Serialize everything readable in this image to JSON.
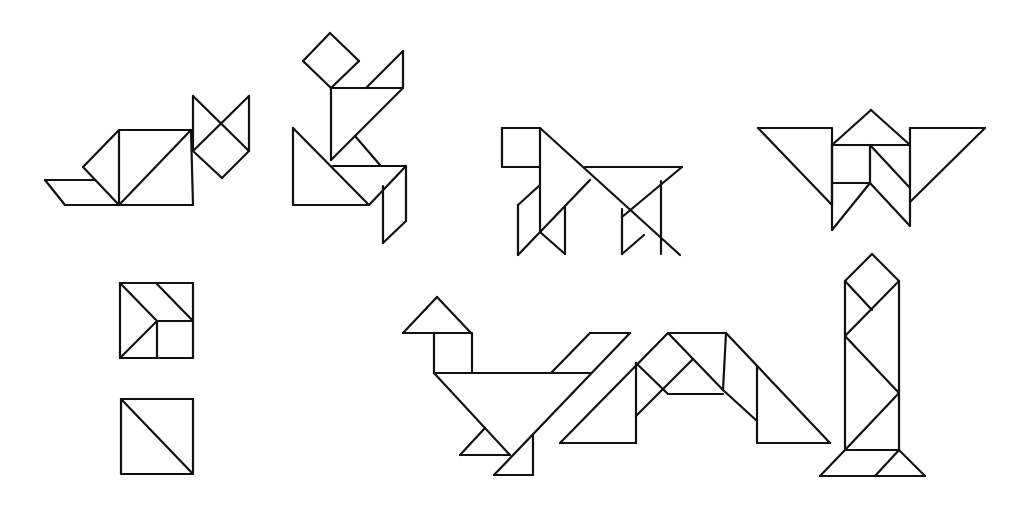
{
  "diagram": {
    "title": "",
    "background": "#ffffff",
    "stroke_color": "#111111",
    "figures": [
      {
        "name": "cat",
        "segments": [
          [
            45,
            180,
            95,
            180
          ],
          [
            45,
            180,
            65,
            205
          ],
          [
            65,
            205,
            193,
            205
          ],
          [
            83,
            167,
            119,
            130
          ],
          [
            83,
            167,
            119,
            205
          ],
          [
            119,
            130,
            119,
            205
          ],
          [
            119,
            130,
            191,
            130
          ],
          [
            119,
            205,
            191,
            130
          ],
          [
            191,
            130,
            193,
            205
          ],
          [
            193,
            96,
            249,
            151
          ],
          [
            193,
            96,
            193,
            151
          ],
          [
            193,
            151,
            222,
            178
          ],
          [
            222,
            178,
            249,
            151
          ],
          [
            249,
            96,
            249,
            151
          ],
          [
            193,
            151,
            249,
            96
          ]
        ]
      },
      {
        "name": "runner",
        "segments": [
          [
            303,
            61,
            330,
            33
          ],
          [
            330,
            33,
            359,
            61
          ],
          [
            359,
            61,
            331,
            88
          ],
          [
            303,
            61,
            331,
            88
          ],
          [
            331,
            88,
            331,
            160
          ],
          [
            331,
            88,
            403,
            88
          ],
          [
            366,
            88,
            403,
            51
          ],
          [
            403,
            51,
            403,
            88
          ],
          [
            403,
            88,
            331,
            160
          ],
          [
            355,
            136,
            380,
            165
          ],
          [
            293,
            128,
            293,
            205
          ],
          [
            293,
            205,
            369,
            205
          ],
          [
            293,
            128,
            369,
            205
          ],
          [
            333,
            166,
            406,
            166
          ],
          [
            406,
            166,
            369,
            205
          ],
          [
            383,
            186,
            383,
            243
          ],
          [
            406,
            166,
            406,
            221
          ],
          [
            406,
            221,
            383,
            243
          ]
        ]
      },
      {
        "name": "dog",
        "segments": [
          [
            502,
            128,
            540,
            128
          ],
          [
            502,
            128,
            502,
            167
          ],
          [
            502,
            167,
            540,
            167
          ],
          [
            540,
            128,
            540,
            232
          ],
          [
            540,
            128,
            680,
            255
          ],
          [
            585,
            167,
            682,
            167
          ],
          [
            682,
            167,
            622,
            217
          ],
          [
            590,
            180,
            518,
            255
          ],
          [
            518,
            205,
            540,
            185
          ],
          [
            518,
            205,
            518,
            255
          ],
          [
            540,
            232,
            565,
            254
          ],
          [
            565,
            206,
            565,
            254
          ],
          [
            622,
            209,
            622,
            254
          ],
          [
            622,
            254,
            644,
            235
          ],
          [
            661,
            181,
            661,
            254
          ]
        ]
      },
      {
        "name": "butterfly",
        "segments": [
          [
            758,
            128,
            832,
            128
          ],
          [
            832,
            128,
            832,
            205
          ],
          [
            758,
            128,
            832,
            205
          ],
          [
            832,
            145,
            910,
            145
          ],
          [
            832,
            145,
            871,
            110
          ],
          [
            871,
            110,
            910,
            145
          ],
          [
            832,
            145,
            832,
            230
          ],
          [
            832,
            183,
            870,
            183
          ],
          [
            870,
            145,
            870,
            183
          ],
          [
            870,
            183,
            832,
            230
          ],
          [
            870,
            145,
            910,
            188
          ],
          [
            870,
            183,
            910,
            226
          ],
          [
            910,
            128,
            985,
            128
          ],
          [
            910,
            128,
            910,
            226
          ],
          [
            985,
            128,
            910,
            202
          ]
        ]
      },
      {
        "name": "square-dissection",
        "segments": [
          [
            120,
            283,
            193,
            283
          ],
          [
            193,
            283,
            193,
            358
          ],
          [
            120,
            358,
            193,
            358
          ],
          [
            120,
            283,
            120,
            358
          ],
          [
            120,
            283,
            157,
            321
          ],
          [
            120,
            358,
            157,
            321
          ],
          [
            157,
            321,
            193,
            321
          ],
          [
            157,
            321,
            157,
            358
          ],
          [
            156,
            283,
            193,
            321
          ]
        ]
      },
      {
        "name": "square-halves",
        "segments": [
          [
            121,
            399,
            193,
            399
          ],
          [
            193,
            399,
            193,
            474
          ],
          [
            121,
            474,
            193,
            474
          ],
          [
            121,
            399,
            121,
            474
          ],
          [
            121,
            399,
            193,
            474
          ]
        ]
      },
      {
        "name": "bird",
        "segments": [
          [
            403,
            333,
            471,
            333
          ],
          [
            403,
            333,
            437,
            297
          ],
          [
            437,
            297,
            471,
            333
          ],
          [
            434,
            333,
            434,
            373
          ],
          [
            472,
            333,
            472,
            373
          ],
          [
            434,
            373,
            590,
            373
          ],
          [
            434,
            373,
            510,
            455
          ],
          [
            551,
            373,
            590,
            333
          ],
          [
            590,
            333,
            630,
            333
          ],
          [
            630,
            333,
            494,
            475
          ],
          [
            460,
            455,
            510,
            455
          ],
          [
            460,
            455,
            485,
            428
          ],
          [
            533,
            434,
            533,
            475
          ],
          [
            494,
            475,
            533,
            475
          ]
        ]
      },
      {
        "name": "bridge",
        "segments": [
          [
            560,
            443,
            636,
            443
          ],
          [
            636,
            363,
            636,
            443
          ],
          [
            560,
            443,
            668,
            333
          ],
          [
            636,
            363,
            668,
            394
          ],
          [
            636,
            416,
            693,
            359
          ],
          [
            668,
            333,
            726,
            333
          ],
          [
            668,
            333,
            723,
            390
          ],
          [
            668,
            394,
            723,
            394
          ],
          [
            726,
            333,
            723,
            390
          ],
          [
            726,
            333,
            830,
            443
          ],
          [
            723,
            390,
            757,
            421
          ],
          [
            757,
            366,
            757,
            443
          ],
          [
            757,
            443,
            830,
            443
          ]
        ]
      },
      {
        "name": "tower",
        "segments": [
          [
            872,
            254,
            899,
            281
          ],
          [
            872,
            254,
            845,
            281
          ],
          [
            845,
            281,
            845,
            450
          ],
          [
            899,
            281,
            899,
            450
          ],
          [
            845,
            281,
            872,
            310
          ],
          [
            899,
            281,
            845,
            336
          ],
          [
            845,
            336,
            899,
            393
          ],
          [
            899,
            393,
            845,
            450
          ],
          [
            845,
            450,
            899,
            450
          ],
          [
            845,
            450,
            820,
            476
          ],
          [
            820,
            476,
            925,
            476
          ],
          [
            899,
            450,
            925,
            476
          ],
          [
            899,
            450,
            875,
            476
          ]
        ]
      }
    ]
  }
}
